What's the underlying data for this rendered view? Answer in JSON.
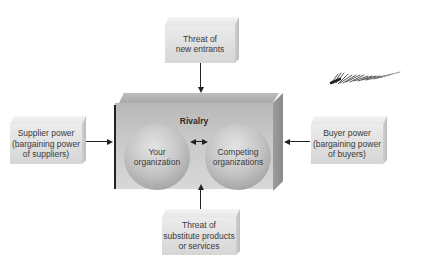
{
  "diagram": {
    "center": {
      "label": "Rivalry",
      "left_sphere": "Your organization",
      "right_sphere": "Competing organizations"
    },
    "forces": {
      "top": {
        "line1": "Threat of",
        "line2": "new entrants"
      },
      "left": {
        "line1": "Supplier power",
        "line2": "(bargaining power",
        "line3": "of suppliers)"
      },
      "right": {
        "line1": "Buyer power",
        "line2": "(bargaining power",
        "line3": "of buyers)"
      },
      "bottom": {
        "line1": "Threat of",
        "line2": "substitute products",
        "line3": "or services"
      }
    },
    "colors": {
      "box_front": "#dedede",
      "rivalry_box": "#c8c8c8",
      "sphere": "#c6c6c6",
      "arrow": "#222222",
      "text": "#3a3a3a"
    }
  }
}
